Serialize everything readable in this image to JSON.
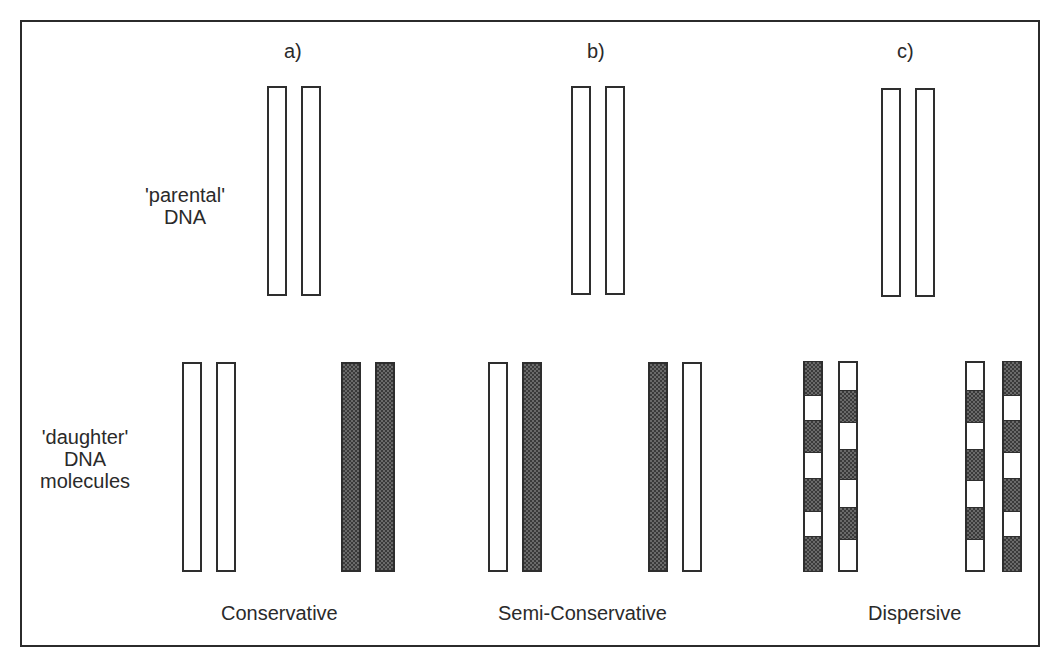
{
  "figure": {
    "panels": [
      {
        "id": "a",
        "label": "a)",
        "model": "Conservative"
      },
      {
        "id": "b",
        "label": "b)",
        "model": "Semi-Conservative"
      },
      {
        "id": "c",
        "label": "c)",
        "model": "Dispersive"
      }
    ],
    "row_labels": {
      "parental": [
        "'parental'",
        "DNA"
      ],
      "daughter": [
        "'daughter'",
        "DNA",
        "molecules"
      ]
    },
    "legend": {
      "white_strand": "parental (old) DNA strand",
      "hatched_strand": "newly synthesized DNA strand"
    },
    "colors": {
      "outline": "#2e2e2e",
      "hatch_fill": "#3a3a3a",
      "background": "#ffffff"
    }
  }
}
